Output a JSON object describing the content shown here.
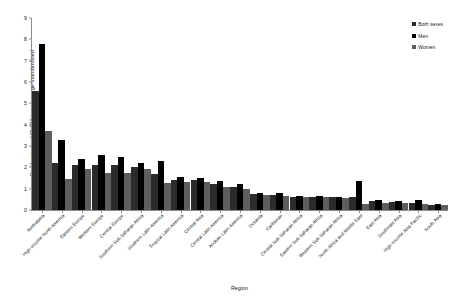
{
  "chart_data": {
    "type": "bar",
    "title": "",
    "xlabel": "Region",
    "ylabel": "Death rate per 100 000 persons, age-standardised",
    "ylim": [
      0,
      9
    ],
    "yticks": [
      0,
      1,
      2,
      3,
      4,
      5,
      6,
      7,
      8,
      9
    ],
    "grid": false,
    "legend_position": "top-right",
    "categories": [
      "Australasia",
      "High-income North America",
      "Eastern Europe",
      "Western Europe",
      "Central Europe",
      "Southern Sub-Saharan Africa",
      "Southern Latin America",
      "Tropical Latin America",
      "Central Asia",
      "Central Latin America",
      "Andean Latin America",
      "Oceania",
      "Caribbean",
      "Central Sub-Saharan Africa",
      "Eastern Sub-Saharan Africa",
      "Western Sub-Saharan Africa",
      "North Africa and Middle East",
      "East Asia",
      "Southeast Asia",
      "High-income Asia Pacific",
      "South Asia"
    ],
    "series": [
      {
        "name": "Both sexes",
        "color": "#2b2b2b",
        "values": [
          5.6,
          2.2,
          2.1,
          2.1,
          2.1,
          2.0,
          1.7,
          1.4,
          1.4,
          1.2,
          1.1,
          0.75,
          0.72,
          0.62,
          0.62,
          0.6,
          0.62,
          0.4,
          0.38,
          0.35,
          0.25
        ]
      },
      {
        "name": "Men",
        "color": "#000000",
        "values": [
          7.8,
          3.3,
          2.4,
          2.6,
          2.5,
          2.2,
          2.3,
          1.55,
          1.5,
          1.35,
          1.2,
          0.8,
          0.8,
          0.65,
          0.65,
          0.62,
          1.35,
          0.48,
          0.42,
          0.45,
          0.3
        ]
      },
      {
        "name": "Women",
        "color": "#5e5e5e",
        "values": [
          3.7,
          1.45,
          1.9,
          1.75,
          1.75,
          1.9,
          1.25,
          1.3,
          1.3,
          1.1,
          1.0,
          0.7,
          0.65,
          0.6,
          0.6,
          0.58,
          0.3,
          0.35,
          0.35,
          0.28,
          0.22
        ]
      }
    ]
  },
  "legend": {
    "items": [
      {
        "label": "Both sexes",
        "color": "#2b2b2b"
      },
      {
        "label": "Men",
        "color": "#000000"
      },
      {
        "label": "Women",
        "color": "#5e5e5e"
      }
    ]
  }
}
